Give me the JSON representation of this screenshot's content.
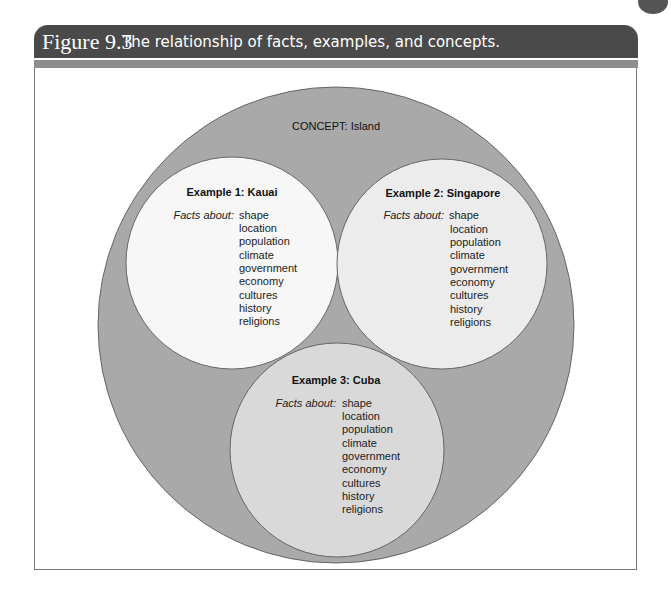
{
  "header": {
    "figure_number": "Figure 9.3",
    "title": "The relationship of facts, examples, and concepts."
  },
  "colors": {
    "header_bg": "#4a4a4a",
    "stripe": "#8e8e8e",
    "concept_fill": "#a9a9a9",
    "example1_fill": "#f7f7f7",
    "example2_fill": "#ececec",
    "example3_fill": "#d9d9d9"
  },
  "diagram": {
    "concept_label": "CONCEPT: Island",
    "facts_label": "Facts about:",
    "examples": [
      {
        "title": "Example 1: Kauai",
        "facts": [
          "shape",
          "location",
          "population",
          "climate",
          "government",
          "economy",
          "cultures",
          "history",
          "religions"
        ]
      },
      {
        "title": "Example 2: Singapore",
        "facts": [
          "shape",
          "location",
          "population",
          "climate",
          "government",
          "economy",
          "cultures",
          "history",
          "religions"
        ]
      },
      {
        "title": "Example 3: Cuba",
        "facts": [
          "shape",
          "location",
          "population",
          "climate",
          "government",
          "economy",
          "cultures",
          "history",
          "religions"
        ]
      }
    ]
  }
}
